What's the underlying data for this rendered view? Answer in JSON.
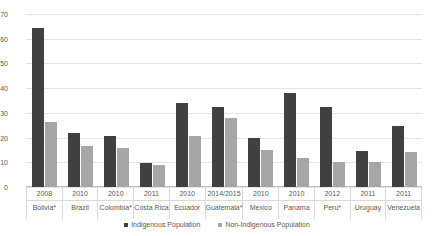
{
  "chart_data": {
    "type": "bar",
    "title": "",
    "subtitle": "",
    "xlabel": "",
    "ylabel": "",
    "ylim": [
      0,
      70
    ],
    "ytick_step": 10,
    "yticks": [
      0,
      10,
      20,
      30,
      40,
      50,
      60,
      70
    ],
    "grid": true,
    "legend_position": "bottom",
    "categories": [
      "Bolivia*",
      "Brazil",
      "Colombia*",
      "Costa Rica",
      "Ecuador",
      "Guatemala*",
      "Mexico",
      "Panama",
      "Peru*",
      "Uruguay",
      "Venezuela"
    ],
    "category_years": [
      "2008",
      "2010",
      "2010",
      "2011",
      "2010",
      "2014/2015",
      "2010",
      "2010",
      "2012",
      "2011",
      "2011"
    ],
    "series": [
      {
        "name": "Indigenous Population",
        "color": "#404040",
        "values": [
          64.5,
          21.8,
          20.8,
          9.9,
          33.9,
          32.3,
          19.9,
          38.1,
          32.3,
          14.5,
          24.5
        ]
      },
      {
        "name": "Non-Indigenous Population",
        "color": "#a6a6a6",
        "values": [
          26.5,
          16.6,
          15.7,
          8.9,
          20.8,
          27.9,
          14.8,
          11.8,
          10.3,
          10.2,
          14.0
        ]
      }
    ]
  },
  "legend": {
    "items": [
      {
        "label": "Indigenous Population"
      },
      {
        "label": "Non-Indigenous Population"
      }
    ]
  }
}
